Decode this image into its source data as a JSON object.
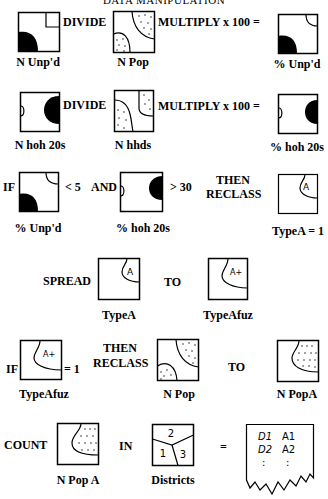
{
  "title": "DATA MANIPULATION",
  "rows": [
    {
      "id": "row1",
      "operator1": "DIVIDE",
      "operator2": "MULTIPLY x 100 =",
      "labels": [
        "N Unp'd",
        "N Pop",
        "% Unp'd"
      ]
    },
    {
      "id": "row2",
      "operator1": "DIVIDE",
      "operator2": "MULTIPLY x 100 =",
      "labels": [
        "N hoh 20s",
        "N hhds",
        "% hoh 20s"
      ]
    },
    {
      "id": "row3",
      "prefix": "IF",
      "cond1": "< 5",
      "and": "AND",
      "cond2": "> 30",
      "then": "THEN",
      "reclass": "RECLASS",
      "labels": [
        "% Unp'd",
        "% hoh 20s",
        "TypeA = 1"
      ],
      "map_glyph": "A"
    },
    {
      "id": "row4",
      "verb": "SPREAD",
      "to": "TO",
      "labels": [
        "TypeA",
        "TypeAfuz"
      ],
      "map_glyphs": [
        "A",
        "A+"
      ]
    },
    {
      "id": "row5",
      "prefix": "IF",
      "cond": "= 1",
      "then": "THEN",
      "reclass": "RECLASS",
      "to": "TO",
      "labels": [
        "TypeAfuz",
        "N Pop",
        "N PopA"
      ],
      "map_glyph": "A+"
    },
    {
      "id": "row6",
      "verb": "COUNT",
      "in": "IN",
      "equals": "=",
      "labels": [
        "N Pop A",
        "Districts"
      ],
      "district_numbers": [
        "2",
        "1",
        "3"
      ],
      "table": {
        "rows": [
          [
            "D1",
            "A1"
          ],
          [
            "D2",
            "A2"
          ]
        ],
        "continuation": ":"
      }
    }
  ]
}
